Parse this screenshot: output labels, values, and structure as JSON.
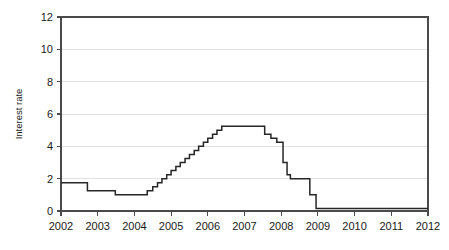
{
  "chart_data": {
    "type": "line",
    "title": "",
    "xlabel": "",
    "ylabel": "Interest rate",
    "xlim": [
      2002,
      2012
    ],
    "ylim": [
      0,
      12
    ],
    "grid": true,
    "legend": "none",
    "x_ticks": [
      "2002",
      "2003",
      "2004",
      "2005",
      "2006",
      "2007",
      "2008",
      "2009",
      "2010",
      "2011",
      "2012"
    ],
    "y_ticks": [
      "0",
      "2",
      "4",
      "6",
      "8",
      "10",
      "12"
    ],
    "x_tick_values": [
      2002,
      2003,
      2004,
      2005,
      2006,
      2007,
      2008,
      2009,
      2010,
      2011,
      2012
    ],
    "y_tick_values": [
      0,
      2,
      4,
      6,
      8,
      10,
      12
    ],
    "series": [
      {
        "name": "Interest rate",
        "color": "#262626",
        "step": "post",
        "x": [
          2002.0,
          2002.72,
          2002.72,
          2003.0,
          2003.2,
          2003.2,
          2003.48,
          2003.48,
          2004.35,
          2004.35,
          2004.5,
          2004.5,
          2004.63,
          2004.63,
          2004.75,
          2004.75,
          2004.88,
          2004.88,
          2005.0,
          2005.0,
          2005.13,
          2005.13,
          2005.25,
          2005.25,
          2005.38,
          2005.38,
          2005.5,
          2005.5,
          2005.63,
          2005.63,
          2005.75,
          2005.75,
          2005.88,
          2005.88,
          2006.0,
          2006.0,
          2006.13,
          2006.13,
          2006.25,
          2006.25,
          2006.38,
          2006.38,
          2006.5,
          2006.5,
          2007.55,
          2007.55,
          2007.72,
          2007.72,
          2007.88,
          2007.88,
          2008.05,
          2008.05,
          2008.16,
          2008.16,
          2008.25,
          2008.25,
          2008.38,
          2008.38,
          2008.78,
          2008.78,
          2008.95,
          2008.95,
          2009.05,
          2012.0
        ],
        "y": [
          1.75,
          1.75,
          1.25,
          1.25,
          1.25,
          1.25,
          1.25,
          1.0,
          1.0,
          1.25,
          1.25,
          1.5,
          1.5,
          1.75,
          1.75,
          2.0,
          2.0,
          2.25,
          2.25,
          2.5,
          2.5,
          2.75,
          2.75,
          3.0,
          3.0,
          3.25,
          3.25,
          3.5,
          3.5,
          3.75,
          3.75,
          4.0,
          4.0,
          4.25,
          4.25,
          4.5,
          4.5,
          4.75,
          4.75,
          5.0,
          5.0,
          5.25,
          5.25,
          5.25,
          5.25,
          4.75,
          4.75,
          4.5,
          4.5,
          4.25,
          4.25,
          3.0,
          3.0,
          2.25,
          2.25,
          2.0,
          2.0,
          2.0,
          2.0,
          1.0,
          1.0,
          0.15,
          0.15,
          0.15
        ]
      }
    ],
    "annotations": [],
    "description_points": [
      {
        "x": "2002",
        "y": 1.75
      },
      {
        "x": "late 2002",
        "y": 1.25
      },
      {
        "x": "mid 2003",
        "y": 1.0
      },
      {
        "x": "mid 2004",
        "y": 1.25
      },
      {
        "x": "mid 2006",
        "y": 5.25
      },
      {
        "x": "late 2007",
        "y": 4.5
      },
      {
        "x": "mid 2008",
        "y": 2.0
      },
      {
        "x": "late 2008",
        "y": 0.15
      },
      {
        "x": "2009-2012",
        "y": 0.15
      }
    ]
  },
  "axis": {
    "y_title": "Interest rate"
  }
}
